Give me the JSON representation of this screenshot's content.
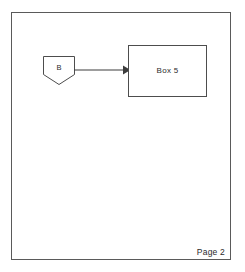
{
  "page": {
    "footer_label": "Page 2",
    "background_color": "#ffffff",
    "border_color": "#5a5a5a"
  },
  "diagram": {
    "type": "flowchart",
    "stroke_color": "#4d4d4d",
    "text_color": "#2b2b2b",
    "nodes": [
      {
        "id": "connector-b",
        "shape": "off-page-connector",
        "label": "B",
        "x": 43,
        "y": 56,
        "width": 32,
        "height": 29
      },
      {
        "id": "box-5",
        "shape": "rectangle",
        "label": "Box 5",
        "x": 128,
        "y": 45,
        "width": 79,
        "height": 52
      }
    ],
    "edges": [
      {
        "id": "edge-b-to-box5",
        "from": "connector-b",
        "to": "box-5",
        "style": "solid",
        "arrowhead": "filled-triangle",
        "direction": "right"
      }
    ]
  }
}
